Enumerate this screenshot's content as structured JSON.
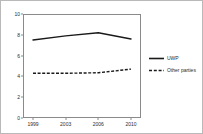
{
  "chart_data": {
    "type": "line",
    "title": "",
    "subtitle": "",
    "xlabel": "",
    "ylabel": "",
    "categories": [
      "1999",
      "2003",
      "2006",
      "2010"
    ],
    "x_tick_labels": [
      "1999",
      "2003",
      "2006",
      "2010"
    ],
    "y_tick_labels": [
      "0",
      "2",
      "4",
      "6",
      "8",
      "10"
    ],
    "y_ticks": [
      0,
      2,
      4,
      6,
      8,
      10
    ],
    "ylim": [
      0,
      10
    ],
    "grid": false,
    "legend_position": "right",
    "series": [
      {
        "name": "UWP",
        "style": "solid",
        "color": "#1a1a1a",
        "values": [
          7.5,
          7.9,
          8.2,
          7.6
        ]
      },
      {
        "name": "Other parties",
        "style": "dashed",
        "color": "#1a1a1a",
        "values": [
          4.3,
          4.3,
          4.35,
          4.7
        ]
      }
    ],
    "annotations": []
  },
  "legend": {
    "items": [
      {
        "label": "UWP",
        "marker": "solid-line-swatch"
      },
      {
        "label": "Other parties",
        "marker": "dashed-line-swatch"
      }
    ]
  }
}
